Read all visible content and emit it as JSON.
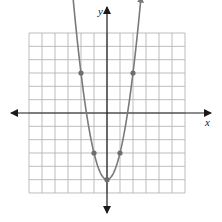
{
  "chart_data": {
    "type": "line",
    "title": "",
    "function": "y = 2x^2 - 5",
    "xlabel": "x",
    "ylabel": "y",
    "xlim": [
      -6,
      6
    ],
    "ylim": [
      -6,
      6
    ],
    "grid": true,
    "grid_cells": 12,
    "curve": {
      "shape": "parabola",
      "vertex": [
        0,
        -5
      ],
      "opens": "up",
      "arrows_at_ends": true
    },
    "points": [
      {
        "x": -2,
        "y": 3
      },
      {
        "x": -1,
        "y": -3
      },
      {
        "x": 0,
        "y": -5
      },
      {
        "x": 1,
        "y": -3
      },
      {
        "x": 2,
        "y": 3
      }
    ],
    "colors": {
      "grid": "#b5b5b5",
      "axis": "#1a1a1a",
      "curve": "#7a7a7a",
      "points": "#6e6e6e"
    }
  },
  "labels": {
    "x_axis": "x",
    "y_axis": "y"
  }
}
